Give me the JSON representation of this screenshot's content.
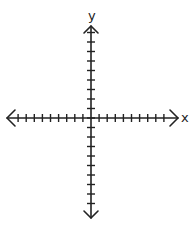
{
  "diagram": {
    "type": "coordinate-plane",
    "x_axis_label": "x",
    "y_axis_label": "y",
    "ticks_per_half_axis": 9,
    "line_color": "#222222",
    "background": "#ffffff"
  }
}
